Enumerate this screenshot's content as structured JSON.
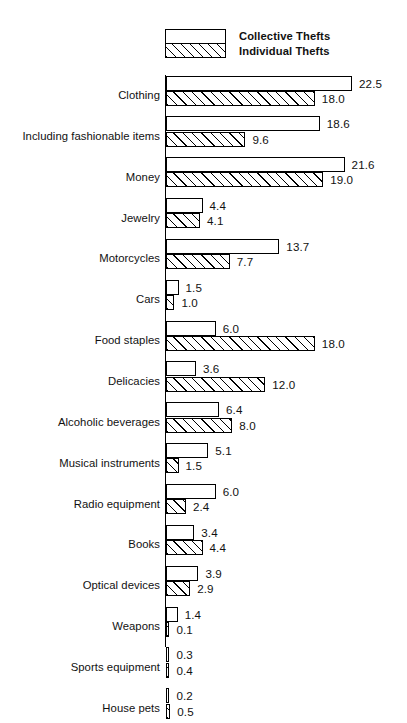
{
  "legend": {
    "collective_label": "Collective Thefts",
    "individual_label": "Individual Thefts"
  },
  "chart_data": {
    "type": "bar",
    "orientation": "horizontal",
    "title": "",
    "subtitle": "",
    "xlabel": "",
    "ylabel": "",
    "grid": false,
    "legend_position": "top",
    "axis_visible": "y-axis-only",
    "xlim": [
      0,
      22.5
    ],
    "value_label_format": "one-decimal",
    "categories": [
      "Clothing",
      "Including fashionable items",
      "Money",
      "Jewelry",
      "Motorcycles",
      "Cars",
      "Food staples",
      "Delicacies",
      "Alcoholic beverages",
      "Musical instruments",
      "Radio equipment",
      "Books",
      "Optical devices",
      "Weapons",
      "Sports equipment",
      "House pets"
    ],
    "series": [
      {
        "name": "Collective Thefts",
        "fill": "white",
        "values": [
          22.5,
          18.6,
          21.6,
          4.4,
          13.7,
          1.5,
          6.0,
          3.6,
          6.4,
          5.1,
          6.0,
          3.4,
          3.9,
          1.4,
          0.3,
          0.2
        ],
        "labels": [
          "22.5",
          "18.6",
          "21.6",
          "4.4",
          "13.7",
          "1.5",
          "6.0",
          "3.6",
          "6.4",
          "5.1",
          "6.0",
          "3.4",
          "3.9",
          "1.4",
          "0.3",
          "0.2"
        ]
      },
      {
        "name": "Individual Thefts",
        "fill": "hatched",
        "values": [
          18.0,
          9.6,
          19.0,
          4.1,
          7.7,
          1.0,
          18.0,
          12.0,
          8.0,
          1.5,
          2.4,
          4.4,
          2.9,
          0.1,
          0.4,
          0.5
        ],
        "labels": [
          "18.0",
          "9.6",
          "19.0",
          "4.1",
          "7.7",
          "1.0",
          "18.0",
          "12.0",
          "8.0",
          "1.5",
          "2.4",
          "4.4",
          "2.9",
          "0.1",
          "0.4",
          "0.5"
        ]
      }
    ]
  }
}
